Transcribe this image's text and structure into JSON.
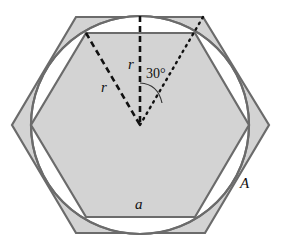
{
  "diagram": {
    "colors": {
      "fill": "#d3d3d3",
      "stroke": "#6b6b6b",
      "circle_stroke": "#6b6b6b",
      "dash": "#111111",
      "background": "#ffffff"
    },
    "labels": {
      "radius_vertical": "r",
      "radius_diagonal": "r",
      "angle": "30°",
      "inner_side": "a",
      "outer_shape": "A"
    }
  }
}
